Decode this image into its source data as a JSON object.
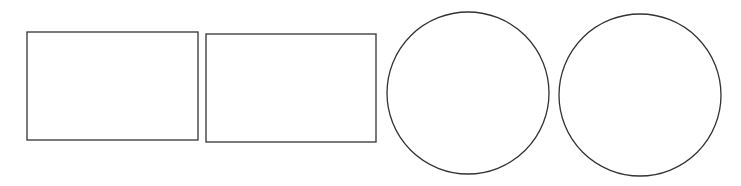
{
  "canvas": {
    "width": 741,
    "height": 186,
    "background": "#ffffff"
  },
  "stroke": {
    "color": "#333333",
    "width": 1.3
  },
  "shapes": {
    "rectangles": [
      {
        "x": 27,
        "y": 32,
        "width": 171,
        "height": 108
      },
      {
        "x": 206,
        "y": 34,
        "width": 170,
        "height": 108
      }
    ],
    "circles": [
      {
        "cx": 468,
        "cy": 93,
        "r": 81
      },
      {
        "cx": 640,
        "cy": 95,
        "r": 81
      }
    ]
  }
}
